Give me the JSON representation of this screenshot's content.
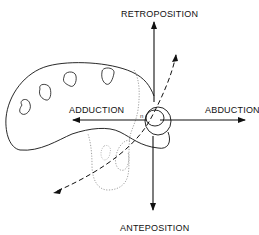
{
  "diagram": {
    "type": "thumb motion axes (hand outline with carpometacarpal joint)",
    "labels": {
      "top": "RETROPOSITION",
      "bottom": "ANTEPOSITION",
      "left": "ADDUCTION",
      "right": "ABDUCTION",
      "small_mark": "n"
    },
    "colors": {
      "line": "#111111",
      "dotted": "#888888",
      "background": "#ffffff"
    },
    "axes": {
      "vertical": {
        "x": 154,
        "y_top": 21,
        "y_bottom": 210
      },
      "horizontal": {
        "y": 120,
        "x_left": 73,
        "x_right": 245
      }
    }
  }
}
